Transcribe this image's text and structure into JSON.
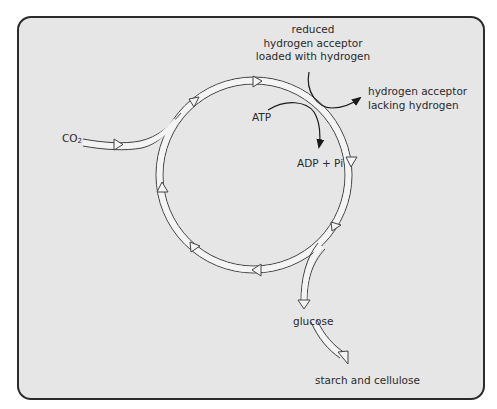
{
  "diagram": {
    "type": "metabolic-cycle",
    "cycle_direction": "clockwise",
    "colors": {
      "panel_background": "#e6e6e6",
      "panel_border": "#2b2b2b",
      "flow_arrow_fill": "#f4f4f4",
      "flow_arrow_stroke": "#444444",
      "reaction_arrow": "#1a1a1a",
      "text": "#2a2a2a"
    },
    "labels": {
      "input_co2": "CO",
      "input_co2_sub": "2",
      "reduced_acceptor_line1": "reduced",
      "reduced_acceptor_line2": "hydrogen acceptor",
      "reduced_acceptor_line3": "loaded with hydrogen",
      "oxidised_acceptor_line1": "hydrogen acceptor",
      "oxidised_acceptor_line2": "lacking hydrogen",
      "atp": "ATP",
      "adp_pi": "ADP + Pi",
      "glucose": "glucose",
      "starch_cellulose": "starch and cellulose"
    },
    "nodes": [
      {
        "id": "co2",
        "label": "CO2",
        "role": "input"
      },
      {
        "id": "cycle",
        "label": "",
        "role": "cycle"
      },
      {
        "id": "glucose",
        "label": "glucose",
        "role": "output"
      },
      {
        "id": "starch",
        "label": "starch and cellulose",
        "role": "product"
      }
    ],
    "edges": [
      {
        "from": "co2",
        "to": "cycle"
      },
      {
        "from": "reduced hydrogen acceptor loaded with hydrogen",
        "to": "hydrogen acceptor lacking hydrogen",
        "via": "cycle"
      },
      {
        "from": "ATP",
        "to": "ADP + Pi",
        "via": "cycle"
      },
      {
        "from": "cycle",
        "to": "glucose"
      },
      {
        "from": "glucose",
        "to": "starch"
      }
    ]
  }
}
